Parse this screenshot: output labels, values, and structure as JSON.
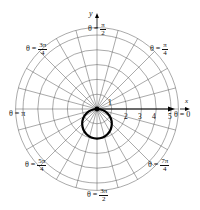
{
  "chart_data": {
    "type": "line",
    "subtype": "polar",
    "title": "",
    "equation_plotted": "r = -2 sin θ",
    "series": [
      {
        "name": "curve",
        "shape": "circle",
        "center_cartesian": [
          0,
          -1
        ],
        "radius": 1,
        "color": "#000000"
      }
    ],
    "radial_axis": {
      "ticks": [
        "1",
        "2",
        "3",
        "4",
        "5"
      ],
      "range": [
        0,
        5.5
      ]
    },
    "angle_labels": [
      {
        "key": "t0",
        "prefix": "θ = ",
        "num": "0",
        "den": ""
      },
      {
        "key": "t1",
        "prefix": "θ = ",
        "num": "π",
        "den": "4"
      },
      {
        "key": "t2",
        "prefix": "θ = ",
        "num": "π",
        "den": "2"
      },
      {
        "key": "t3",
        "prefix": "θ = ",
        "num": "3π",
        "den": "4"
      },
      {
        "key": "t4",
        "prefix": "θ = ",
        "num": "π",
        "den": ""
      },
      {
        "key": "t5",
        "prefix": "θ = ",
        "num": "5π",
        "den": "4"
      },
      {
        "key": "t6",
        "prefix": "θ = ",
        "num": "3π",
        "den": "2"
      },
      {
        "key": "t7",
        "prefix": "θ = ",
        "num": "7π",
        "den": "4"
      }
    ],
    "xlabel": "x",
    "ylabel": "y",
    "grid": true,
    "radial_lines_step": "π/12",
    "concentric_circles": [
      1,
      2,
      3,
      4,
      5,
      5.5
    ]
  },
  "labels": {
    "x_axis": "x",
    "y_axis": "y",
    "theta0": "θ = 0",
    "thetaPi": "θ = π",
    "eq": "θ =",
    "pi": "π",
    "pi_over_den_2": "2",
    "pi_over_den_4": "4",
    "three_pi": "3π",
    "five_pi": "5π",
    "seven_pi": "7π",
    "r1": "1",
    "r2": "2",
    "r3": "3",
    "r4": "4",
    "r5": "5"
  }
}
